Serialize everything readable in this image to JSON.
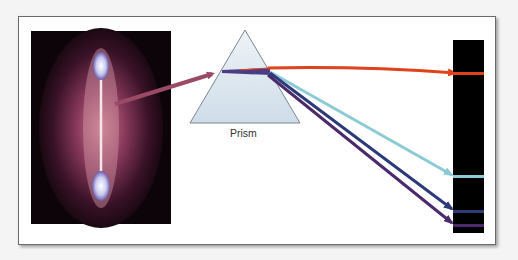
{
  "diagram": {
    "prism_label": "Prism",
    "source": "gas-discharge-tube",
    "colors": {
      "input_arrow": "#9a4a66",
      "red": "#e0421c",
      "cyan": "#8ccad6",
      "blue": "#2c3a78",
      "violet": "#4a2a6a",
      "spectrum_bg": "#000000",
      "prism_fill": "#dbe6ef"
    },
    "spectral_lines": [
      {
        "name": "red-line",
        "color": "#e0421c",
        "y": 73
      },
      {
        "name": "cyan-line",
        "color": "#8ccad6",
        "y": 176
      },
      {
        "name": "blue-line",
        "color": "#2c3a78",
        "y": 211
      },
      {
        "name": "violet-line",
        "color": "#4a2a6a",
        "y": 225
      }
    ]
  }
}
